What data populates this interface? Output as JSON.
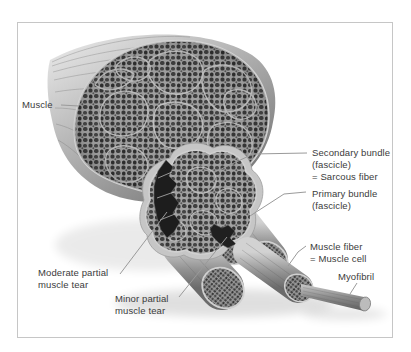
{
  "canvas": {
    "width": 411,
    "height": 352,
    "background": "#ffffff"
  },
  "frame": {
    "border_color": "#c6c6c6"
  },
  "colors": {
    "label_text": "#3b3b3b",
    "leader_line": "#9a9a9a",
    "fascicle_dark": "#383838",
    "fascicle_mortar": "#a2a2a2",
    "cluster_line": "#c6c6c6",
    "sheath_light": "#d6d6d6",
    "sheath_dark": "#6f6f6f",
    "tear_dark": "#1d1d1d"
  },
  "labels": {
    "muscle": "Muscle",
    "secondary_bundle": [
      "Secondary bundle",
      "(fascicle)",
      "= Sarcous fiber"
    ],
    "primary_bundle": [
      "Primary bundle",
      "(fascicle)"
    ],
    "muscle_fiber": [
      "Muscle fiber",
      "= Muscle cell"
    ],
    "myofibril": "Myofibril",
    "moderate_tear": [
      "Moderate partial",
      "muscle tear"
    ],
    "minor_tear": [
      "Minor partial",
      "muscle tear"
    ]
  }
}
